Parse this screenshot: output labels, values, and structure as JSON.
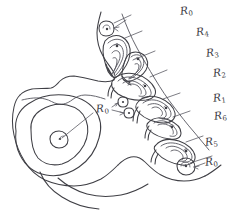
{
  "figure": {
    "style": "pencil line drawing",
    "background_color": "#ffffff",
    "ink_color": "#3f3f45",
    "width": 237,
    "height": 217
  },
  "labels": {
    "r_letter": "R",
    "r0_top": {
      "base": "R",
      "sub": "0"
    },
    "r4": {
      "base": "R",
      "sub": "4"
    },
    "r3": {
      "base": "R",
      "sub": "3"
    },
    "r2": {
      "base": "R",
      "sub": "2"
    },
    "r1": {
      "base": "R",
      "sub": "1"
    },
    "r6": {
      "base": "R",
      "sub": "6"
    },
    "r5": {
      "base": "R",
      "sub": "5"
    },
    "r0_bottom": {
      "base": "R",
      "sub": "0"
    },
    "r0_middle": {
      "base": "R",
      "sub": "0"
    }
  },
  "annotation_order": [
    "R0",
    "R4",
    "R3",
    "R2",
    "R1",
    "R6",
    "R5",
    "R0"
  ],
  "elements": {
    "outer_body_outline": "irregular closed contour occupying the full frame",
    "large_concentric_oval": "three nested ovals at lower-left with a small circle and dot at center",
    "shell_count": 7,
    "small_circle_count": 4,
    "leader_line_count": 9
  }
}
